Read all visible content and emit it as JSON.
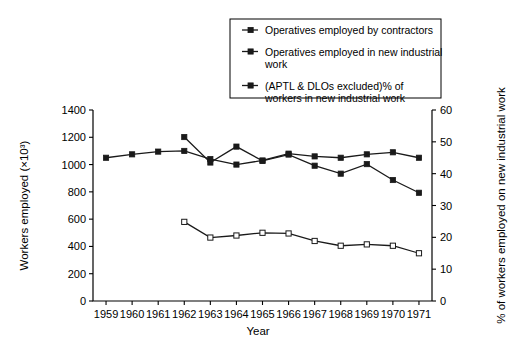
{
  "chart_data": {
    "type": "line",
    "title": "",
    "xlabel": "Year",
    "ylabel": "Workers employed (×10³)",
    "y2label": "% of workers employed on new industrial work",
    "grid": false,
    "legend_position": "top-right",
    "x": [
      1959,
      1960,
      1961,
      1962,
      1963,
      1964,
      1965,
      1966,
      1967,
      1968,
      1969,
      1970,
      1971
    ],
    "xlim": [
      1958.5,
      1971.5
    ],
    "ylim": [
      0,
      1400
    ],
    "y2lim": [
      0,
      60
    ],
    "xticks": [
      "1959",
      "1960",
      "1961",
      "1962",
      "1963",
      "1964",
      "1965",
      "1966",
      "1967",
      "1968",
      "1969",
      "1970",
      "1971"
    ],
    "yticks": [
      "0",
      "200",
      "400",
      "600",
      "800",
      "1000",
      "1200",
      "1400"
    ],
    "ytick_values": [
      0,
      200,
      400,
      600,
      800,
      1000,
      1200,
      1400
    ],
    "y2ticks": [
      "0",
      "10",
      "20",
      "30",
      "40",
      "50",
      "60"
    ],
    "y2tick_values": [
      0,
      10,
      20,
      30,
      40,
      50,
      60
    ],
    "series": [
      {
        "name": "Operatives employed by contractors",
        "axis": "left",
        "marker": "filled-square",
        "x": [
          1959,
          1960,
          1961,
          1962,
          1963,
          1964,
          1965,
          1966,
          1967,
          1968,
          1969,
          1970,
          1971
        ],
        "values": [
          1050,
          1075,
          1095,
          1100,
          1040,
          1000,
          1030,
          1080,
          1060,
          1050,
          1075,
          1090,
          1050
        ]
      },
      {
        "name": "Operatives employed in new industrial work",
        "axis": "left",
        "marker": "open-square",
        "x": [
          1962,
          1963,
          1964,
          1965,
          1966,
          1967,
          1968,
          1969,
          1970,
          1971
        ],
        "values": [
          580,
          465,
          480,
          500,
          495,
          440,
          405,
          415,
          405,
          350
        ]
      },
      {
        "name": "(APTL & DLOs excluded)% of workers in new industrial work",
        "axis": "right",
        "marker": "filled-square",
        "x": [
          1962,
          1963,
          1964,
          1965,
          1966,
          1967,
          1968,
          1969,
          1970,
          1971
        ],
        "values": [
          51.5,
          43.5,
          48.5,
          44.0,
          46.0,
          42.5,
          40.0,
          43.0,
          38.0,
          34.0
        ]
      }
    ]
  },
  "legend": {
    "items": [
      {
        "label": "Operatives employed by contractors",
        "lines": [
          "Operatives employed by contractors"
        ]
      },
      {
        "label": "Operatives employed in new industrial work",
        "lines": [
          "Operatives employed in new industrial",
          "work"
        ]
      },
      {
        "label": "(APTL & DLOs excluded)% of workers in new industrial work",
        "lines": [
          "(APTL & DLOs excluded)% of",
          "workers in new industrial work"
        ]
      }
    ]
  },
  "colors": {
    "line": "#1a1a1a",
    "axis": "#000000",
    "background": "#ffffff"
  }
}
